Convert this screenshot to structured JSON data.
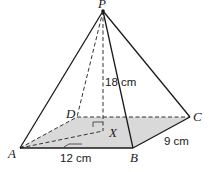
{
  "figure": {
    "type": "rectangular-based pyramid",
    "vertices": {
      "P": {
        "label": "P",
        "x": 103,
        "y": 11
      },
      "A": {
        "label": "A",
        "x": 20,
        "y": 148
      },
      "B": {
        "label": "B",
        "x": 133,
        "y": 148
      },
      "C": {
        "label": "C",
        "x": 190,
        "y": 117
      },
      "D": {
        "label": "D",
        "x": 77,
        "y": 117
      },
      "X": {
        "label": "X",
        "x": 103,
        "y": 131
      }
    },
    "dimensions": {
      "height": "18 cm",
      "AB": "12 cm",
      "BC": "9 cm"
    },
    "colors": {
      "base_fill": "#d9d9d9",
      "line": "#1a1a1a"
    }
  }
}
